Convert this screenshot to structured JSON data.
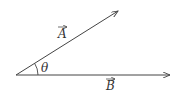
{
  "diagram": {
    "type": "vector-angle",
    "origin": [
      16,
      75
    ],
    "vectors": [
      {
        "name": "A",
        "label": "A",
        "tip": [
          118,
          11
        ],
        "label_pos": [
          58,
          38
        ]
      },
      {
        "name": "B",
        "label": "B",
        "tip": [
          170,
          75
        ],
        "label_pos": [
          106,
          90
        ]
      }
    ],
    "angle": {
      "label": "θ",
      "radius": 22,
      "label_pos": [
        41,
        72
      ]
    },
    "colors": {
      "line": "#444444",
      "text": "#333333"
    }
  }
}
